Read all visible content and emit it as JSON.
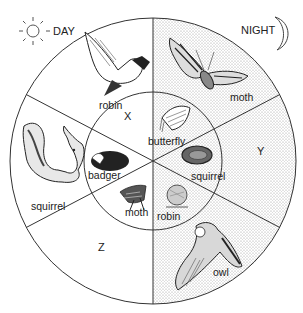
{
  "legend": {
    "day_label": "DAY",
    "night_label": "NIGHT",
    "day_icon": "sun-icon",
    "night_icon": "crescent-moon-icon"
  },
  "sections": {
    "x": "X",
    "y": "Y",
    "z": "Z"
  },
  "outer_ring": {
    "robin": "robin",
    "moth": "moth",
    "squirrel": "squirrel",
    "owl": "owl"
  },
  "inner_ring": {
    "butterfly": "butterfly",
    "badger": "badger",
    "squirrel": "squirrel",
    "moth": "moth",
    "robin": "robin"
  },
  "colors": {
    "line": "#333333",
    "night_shade": "#e4e4e4",
    "background": "#ffffff"
  }
}
